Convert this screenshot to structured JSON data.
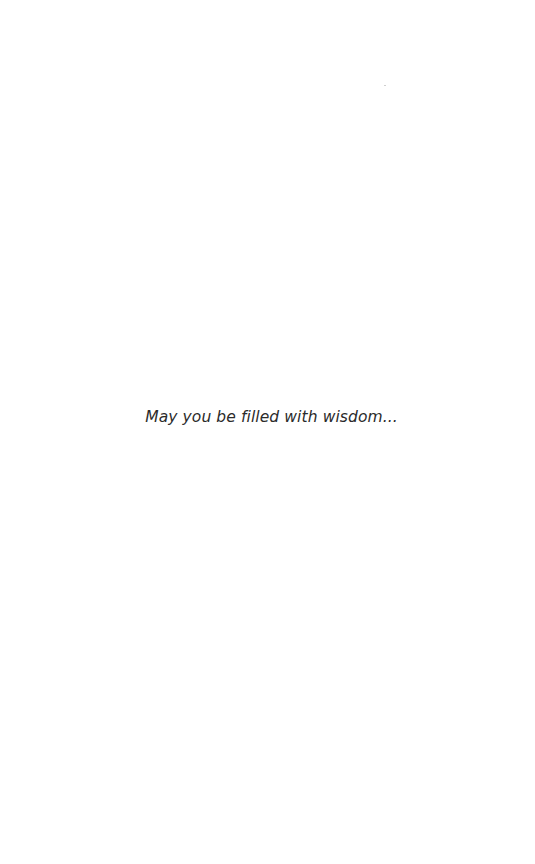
{
  "screen": {
    "background": "#ffffff",
    "message": "May you be filled with wisdom...",
    "text_color": "#2b2b2b"
  }
}
